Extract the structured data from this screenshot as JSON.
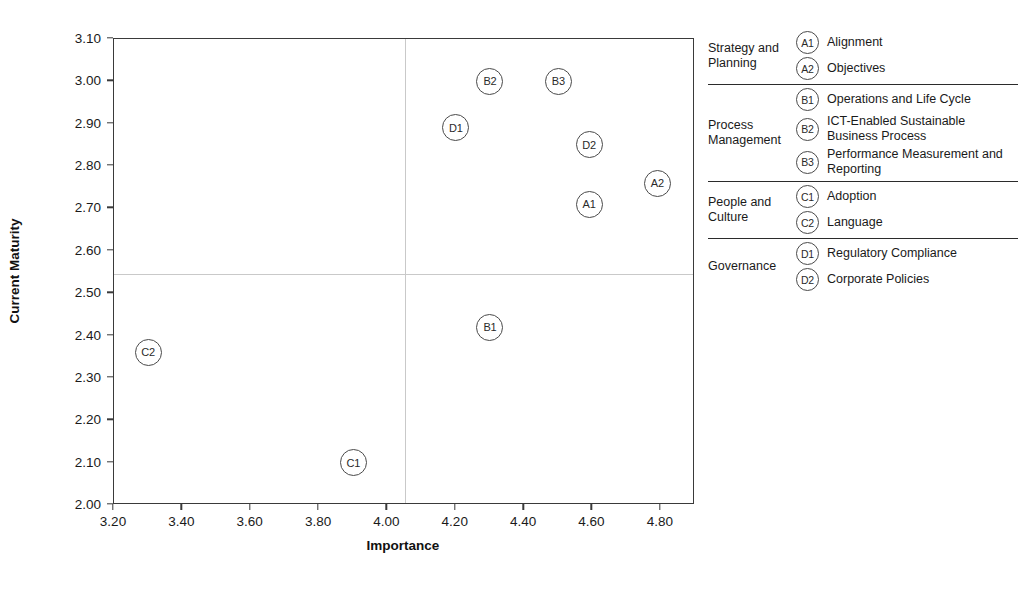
{
  "chart_data": {
    "type": "scatter",
    "title": "",
    "xlabel": "Importance",
    "ylabel": "Current Maturity",
    "xlim": [
      3.2,
      4.9
    ],
    "ylim": [
      2.0,
      3.1
    ],
    "xticks": [
      "3.20",
      "3.40",
      "3.60",
      "3.80",
      "4.00",
      "4.20",
      "4.40",
      "4.60",
      "4.80"
    ],
    "xtick_values": [
      3.2,
      3.4,
      3.6,
      3.8,
      4.0,
      4.2,
      4.4,
      4.6,
      4.8
    ],
    "yticks": [
      "2.00",
      "2.10",
      "2.20",
      "2.30",
      "2.40",
      "2.50",
      "2.60",
      "2.70",
      "2.80",
      "2.90",
      "3.00",
      "3.10"
    ],
    "ytick_values": [
      2.0,
      2.1,
      2.2,
      2.3,
      2.4,
      2.5,
      2.6,
      2.7,
      2.8,
      2.9,
      3.0,
      3.1
    ],
    "grid": false,
    "legend_position": "right",
    "quadrant_lines": {
      "x": 4.05,
      "y": 2.545
    },
    "points": [
      {
        "label": "A1",
        "x": 4.59,
        "y": 2.71
      },
      {
        "label": "A2",
        "x": 4.79,
        "y": 2.76
      },
      {
        "label": "B1",
        "x": 4.3,
        "y": 2.42
      },
      {
        "label": "B2",
        "x": 4.3,
        "y": 3.0
      },
      {
        "label": "B3",
        "x": 4.5,
        "y": 3.0
      },
      {
        "label": "C1",
        "x": 3.9,
        "y": 2.1
      },
      {
        "label": "C2",
        "x": 3.3,
        "y": 2.36
      },
      {
        "label": "D1",
        "x": 4.2,
        "y": 2.89
      },
      {
        "label": "D2",
        "x": 4.59,
        "y": 2.85
      }
    ]
  },
  "legend": {
    "groups": [
      {
        "title": "Strategy and Planning",
        "entries": [
          {
            "code": "A1",
            "text": "Alignment"
          },
          {
            "code": "A2",
            "text": "Objectives"
          }
        ]
      },
      {
        "title": "Process Management",
        "entries": [
          {
            "code": "B1",
            "text": "Operations and Life Cycle"
          },
          {
            "code": "B2",
            "text": "ICT-Enabled Sustainable Business Process"
          },
          {
            "code": "B3",
            "text": "Performance Measurement and Reporting"
          }
        ]
      },
      {
        "title": "People and Culture",
        "entries": [
          {
            "code": "C1",
            "text": "Adoption"
          },
          {
            "code": "C2",
            "text": "Language"
          }
        ]
      },
      {
        "title": "Governance",
        "entries": [
          {
            "code": "D1",
            "text": "Regulatory Compliance"
          },
          {
            "code": "D2",
            "text": "Corporate Policies"
          }
        ]
      }
    ]
  }
}
